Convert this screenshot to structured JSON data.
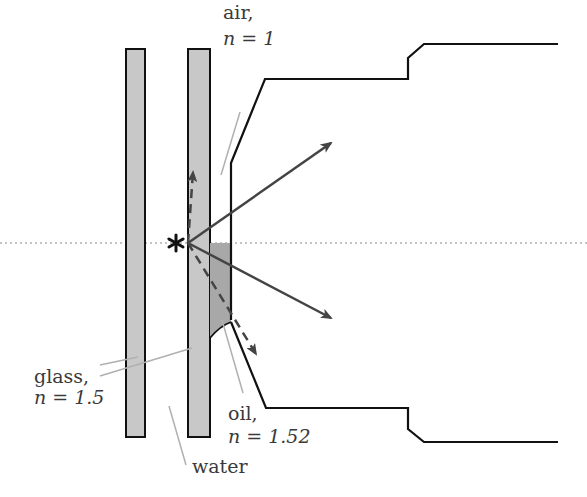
{
  "diagram": {
    "labels": {
      "air_name": "air,",
      "air_n": "n = 1",
      "glass_name": "glass,",
      "glass_n": "n = 1.5",
      "oil_name": "oil,",
      "oil_n": "n = 1.52",
      "water_name": "water"
    },
    "source_symbol": "*",
    "colors": {
      "glass_fill": "#c8c8c8",
      "oil_fill": "#a8a8a8",
      "outline": "#111111",
      "ray": "#444444",
      "leader": "#b0b0b0",
      "axis": "#888888"
    },
    "elements": [
      {
        "name": "left glass slide",
        "type": "rect"
      },
      {
        "name": "right glass slide (coverslip)",
        "type": "rect"
      },
      {
        "name": "oil immersion layer",
        "type": "region"
      },
      {
        "name": "objective lens housing",
        "type": "outline"
      },
      {
        "name": "optical axis",
        "type": "dotted line"
      },
      {
        "name": "point source",
        "type": "star"
      },
      {
        "name": "refracted ray up",
        "type": "solid arrow"
      },
      {
        "name": "refracted ray down",
        "type": "solid arrow"
      },
      {
        "name": "totally reflected ray up",
        "type": "dashed arrow"
      },
      {
        "name": "transmitted ray through oil",
        "type": "dashed arrow"
      }
    ]
  }
}
